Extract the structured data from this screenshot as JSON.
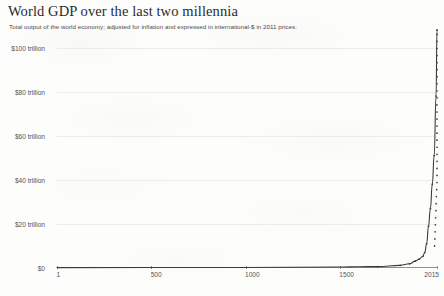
{
  "chart_data": {
    "type": "line",
    "title": "World GDP over the last two millennia",
    "subtitle": "Total output of the world economy; adjusted for inflation and expressed in international-$ in 2011 prices.",
    "xlabel": "",
    "ylabel": "",
    "xlim": [
      1,
      2015
    ],
    "ylim": [
      0,
      108
    ],
    "grid": true,
    "legend": false,
    "y_unit": "trillion international-$ (2011 prices)",
    "y_ticks": [
      {
        "value": 100,
        "label": "$100 trillion"
      },
      {
        "value": 80,
        "label": "$80 trillion"
      },
      {
        "value": 60,
        "label": "$60 trillion"
      },
      {
        "value": 40,
        "label": "$40 trillion"
      },
      {
        "value": 20,
        "label": "$20 trillion"
      },
      {
        "value": 0,
        "label": "$0"
      }
    ],
    "x_ticks": [
      {
        "value": 1,
        "label": "1"
      },
      {
        "value": 500,
        "label": "500"
      },
      {
        "value": 1000,
        "label": "1000"
      },
      {
        "value": 1500,
        "label": "1500"
      },
      {
        "value": 2015,
        "label": "2015"
      }
    ],
    "series": [
      {
        "name": "World GDP",
        "color": "#3b3b3b",
        "markers": true,
        "x": [
          1,
          1000,
          1500,
          1600,
          1700,
          1820,
          1870,
          1900,
          1920,
          1940,
          1950,
          1960,
          1970,
          1980,
          1990,
          2000,
          2010,
          2015
        ],
        "values": [
          0.18,
          0.21,
          0.43,
          0.58,
          0.64,
          1.2,
          1.9,
          3.1,
          4.0,
          5.3,
          7.0,
          11.0,
          19.0,
          27.0,
          38.0,
          51.0,
          78.0,
          108.0
        ]
      }
    ]
  }
}
